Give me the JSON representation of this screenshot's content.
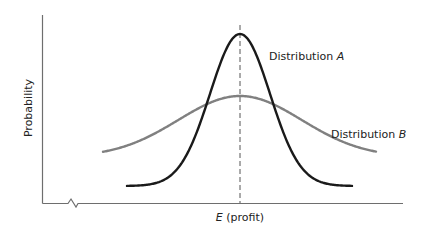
{
  "chart_data": {
    "type": "line",
    "title": "",
    "xlabel_var": "E",
    "xlabel_rest": " (profit)",
    "xlabel": "E (profit)",
    "ylabel": "Probability",
    "grid": false,
    "axis_break_on_x": true,
    "mean_line": {
      "style": "dashed",
      "label": "E (profit)"
    },
    "series": [
      {
        "name": "Distribution A",
        "label_text": "Distribution ",
        "label_var": "A",
        "color": "#1a1a1a",
        "shape": "narrow normal curve, tall peak at expected profit",
        "relative_peak": 1.0,
        "relative_spread": 1.0
      },
      {
        "name": "Distribution B",
        "label_text": "Distribution ",
        "label_var": "B",
        "color": "#808080",
        "shape": "wide normal curve, lower peak at same expected profit",
        "relative_peak": 0.63,
        "relative_spread": 2.1
      }
    ]
  },
  "colors": {
    "axis": "#6e6e6e",
    "dist_a": "#1a1a1a",
    "dist_b": "#808080",
    "mean_line": "#555555"
  }
}
